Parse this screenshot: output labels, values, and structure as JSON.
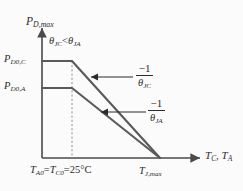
{
  "chart_data": {
    "type": "line",
    "title": "",
    "xlabel": "T_C, T_A",
    "ylabel": "P_D,max",
    "grid": false,
    "legend": "none",
    "x_ticks": [
      {
        "label": "T_A0 = T_C0 = 25°C",
        "x_px": 72
      },
      {
        "label": "T_J,max",
        "x_px": 160
      }
    ],
    "y_ticks": [
      {
        "label": "P_D0,C",
        "y_px": 61
      },
      {
        "label": "P_D0,A",
        "y_px": 88
      }
    ],
    "series": [
      {
        "name": "Case derating (theta_JC)",
        "slope_label": "-1/θ_JC",
        "points": [
          {
            "x": 42,
            "y": 61
          },
          {
            "x": 72,
            "y": 61
          },
          {
            "x": 160,
            "y": 158
          }
        ]
      },
      {
        "name": "Ambient derating (theta_JA)",
        "slope_label": "-1/θ_JA",
        "points": [
          {
            "x": 42,
            "y": 88
          },
          {
            "x": 72,
            "y": 88
          },
          {
            "x": 160,
            "y": 158
          }
        ]
      }
    ],
    "annotations": [
      {
        "name": "theta-inequality",
        "text": "θ_JC < θ_JA"
      },
      {
        "name": "slope-jc",
        "text": "-1/θ_JC"
      },
      {
        "name": "slope-ja",
        "text": "-1/θ_JA"
      }
    ],
    "axis_origin": {
      "x_px": 42,
      "y_px": 158
    }
  },
  "axes": {
    "y_title": {
      "main": "P",
      "sub": "D,max"
    },
    "x_title": {
      "first_main": "T",
      "first_sub": "C",
      "separator": ", ",
      "second_main": "T",
      "second_sub": "A"
    }
  },
  "y_ticks": {
    "upper": {
      "main": "P",
      "sub": "D0,C"
    },
    "lower": {
      "main": "P",
      "sub": "D0,A"
    }
  },
  "x_ticks": {
    "origin": {
      "t_a": "T",
      "t_a_sub": "A0",
      "eq1": "=",
      "t_c": "T",
      "t_c_sub": "C0",
      "eq2": "=",
      "value": "25°C"
    },
    "tj_max": {
      "main": "T",
      "sub": "J,max"
    }
  },
  "annotations": {
    "theta_note": {
      "left_theta": "θ",
      "left_sub": "JC",
      "relation": "<",
      "right_theta": "θ",
      "right_sub": "JA"
    },
    "slope_jc": {
      "numerator": "−1",
      "denom_theta": "θ",
      "denom_sub": "JC"
    },
    "slope_ja": {
      "numerator": "−1",
      "denom_theta": "θ",
      "denom_sub": "JA"
    }
  },
  "colors": {
    "background": "#fbfbfb",
    "line": "#5a5a5a",
    "axis": "#4a4a4a",
    "text": "#2b2b2b",
    "dashed": "#8a8a8a"
  }
}
